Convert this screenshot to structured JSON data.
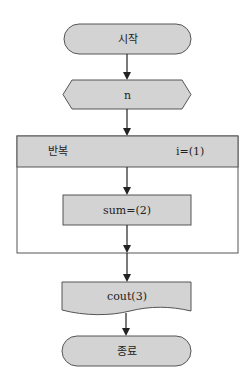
{
  "flowchart": {
    "start": {
      "label": "시작"
    },
    "input": {
      "label": "n"
    },
    "loop": {
      "label": "반복",
      "condition": "i=(1)"
    },
    "process": {
      "label": "sum=(2)"
    },
    "output": {
      "label": "cout(3)"
    },
    "end": {
      "label": "종료"
    }
  },
  "colors": {
    "fill": "#d3d3d3",
    "stroke": "#555555",
    "arrow": "#222222"
  }
}
